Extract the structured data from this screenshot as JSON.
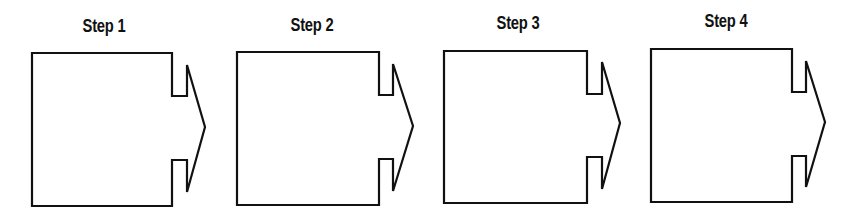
{
  "diagram": {
    "type": "process-flow",
    "stroke_color": "#111111",
    "background": "#ffffff",
    "steps": [
      {
        "label": "Step 1",
        "label_x": 104,
        "label_y": 16,
        "box": {
          "left": 32,
          "top": 53,
          "right": 172,
          "bottom": 206
        },
        "notch": {
          "upper_y": 96,
          "lower_y": 160,
          "x": 187
        },
        "arrow": {
          "top_y": 65,
          "tip_x": 205,
          "tip_y": 127,
          "bottom_y": 192
        }
      },
      {
        "label": "Step 2",
        "label_x": 312,
        "label_y": 15,
        "box": {
          "left": 237,
          "top": 52,
          "right": 379,
          "bottom": 205
        },
        "notch": {
          "upper_y": 95,
          "lower_y": 159,
          "x": 393
        },
        "arrow": {
          "top_y": 64,
          "tip_x": 413,
          "tip_y": 126,
          "bottom_y": 191
        }
      },
      {
        "label": "Step 3",
        "label_x": 518,
        "label_y": 13,
        "box": {
          "left": 444,
          "top": 51,
          "right": 587,
          "bottom": 203
        },
        "notch": {
          "upper_y": 94,
          "lower_y": 157,
          "x": 602
        },
        "arrow": {
          "top_y": 62,
          "tip_x": 620,
          "tip_y": 123,
          "bottom_y": 189
        }
      },
      {
        "label": "Step 4",
        "label_x": 726,
        "label_y": 11,
        "box": {
          "left": 651,
          "top": 49,
          "right": 792,
          "bottom": 202
        },
        "notch": {
          "upper_y": 92,
          "lower_y": 156,
          "x": 806
        },
        "arrow": {
          "top_y": 61,
          "tip_x": 825,
          "tip_y": 122,
          "bottom_y": 187
        }
      }
    ]
  }
}
